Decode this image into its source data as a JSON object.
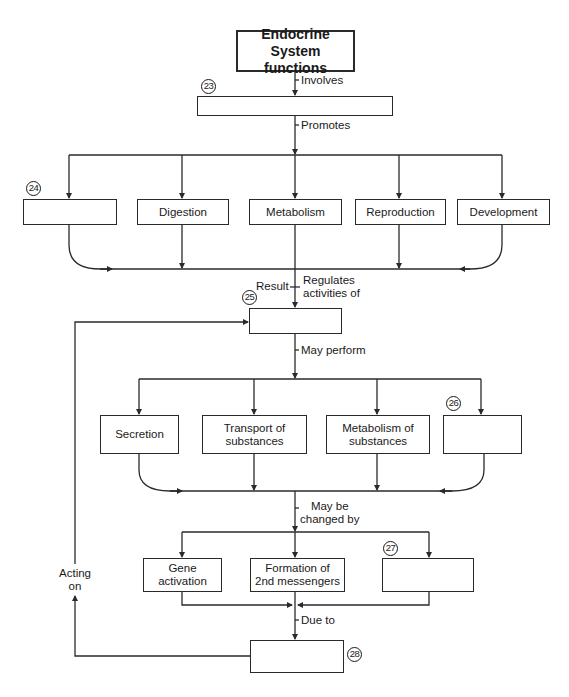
{
  "title": "Endocrine System functions",
  "edge_labels": {
    "involves": "Involves",
    "promotes": "Promotes",
    "result": "Result",
    "regulates_line1": "Regulates",
    "regulates_line2": "activities of",
    "may_perform": "May perform",
    "may_be_line1": "May be",
    "may_be_line2": "changed by",
    "due_to": "Due to",
    "acting_line1": "Acting",
    "acting_line2": "on"
  },
  "blanks": {
    "b23": {
      "number": "23",
      "text": ""
    },
    "b24": {
      "number": "24",
      "text": ""
    },
    "b25": {
      "number": "25",
      "text": ""
    },
    "b26": {
      "number": "26",
      "text": ""
    },
    "b27": {
      "number": "27",
      "text": ""
    },
    "b28": {
      "number": "28",
      "text": ""
    }
  },
  "promoted_processes": [
    "Digestion",
    "Metabolism",
    "Reproduction",
    "Development"
  ],
  "cell_activities": {
    "secretion": "Secretion",
    "transport_line1": "Transport of",
    "transport_line2": "substances",
    "metabolism_line1": "Metabolism of",
    "metabolism_line2": "substances"
  },
  "change_mechanisms": {
    "gene_line1": "Gene",
    "gene_line2": "activation",
    "formation_line1": "Formation of",
    "formation_line2": "2nd messengers"
  },
  "colors": {
    "line": "#2a2a2a",
    "background": "#ffffff"
  }
}
